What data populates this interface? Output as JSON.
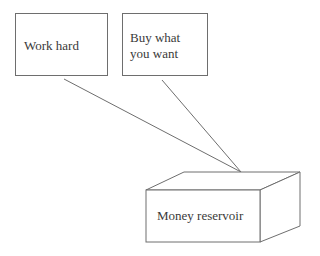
{
  "diagram": {
    "nodes": [
      {
        "id": "work_hard",
        "label": "Work hard",
        "shape": "rectangle"
      },
      {
        "id": "buy_what_you_want",
        "label": "Buy what\nyou want",
        "shape": "rectangle"
      },
      {
        "id": "money_reservoir",
        "label": "Money reservoir",
        "shape": "3d-box"
      }
    ],
    "edges": [
      {
        "from": "work_hard",
        "to": "money_reservoir",
        "style": "line"
      },
      {
        "from": "buy_what_you_want",
        "to": "money_reservoir",
        "style": "line"
      }
    ],
    "colors": {
      "stroke": "#6e6e6e",
      "text": "#3a3a3a",
      "background": "#ffffff"
    }
  }
}
